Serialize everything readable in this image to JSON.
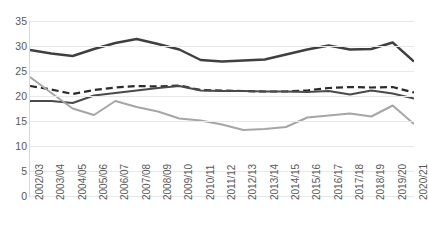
{
  "chart": {
    "title": "",
    "ylabel": "",
    "xlabel": ""
  },
  "chart_data": {
    "type": "line",
    "title": "",
    "subtitle": "",
    "xlabel": "",
    "ylabel": "",
    "ylim": [
      0,
      35
    ],
    "yticks": [
      "0",
      "5",
      "10",
      "15",
      "20",
      "25",
      "30",
      "35"
    ],
    "grid": true,
    "legend": "none",
    "categories": [
      "2002/03",
      "2003/04",
      "2004/05",
      "2005/06",
      "2006/07",
      "2007/08",
      "2008/09",
      "2009/10",
      "2010/11",
      "2011/12",
      "2012/13",
      "2013/14",
      "2014/15",
      "2015/16",
      "2016/17",
      "2017/18",
      "2018/19",
      "2019/20",
      "2020/21"
    ],
    "series": [
      {
        "name": "series-1-dark-solid-upper",
        "style": "solid",
        "color": "#3f3f3f",
        "width": 2.4,
        "values": [
          29.2,
          28.5,
          28.0,
          29.4,
          30.6,
          31.4,
          30.4,
          29.3,
          27.2,
          26.9,
          27.1,
          27.3,
          28.3,
          29.3,
          30.1,
          29.3,
          29.4,
          30.7,
          26.9
        ]
      },
      {
        "name": "series-2-dark-dashed",
        "style": "dashed",
        "color": "#2b2b2b",
        "width": 2.2,
        "values": [
          22.0,
          21.3,
          20.4,
          21.2,
          21.7,
          22.0,
          21.9,
          22.1,
          21.2,
          21.1,
          21.0,
          20.9,
          20.9,
          21.1,
          21.6,
          21.8,
          21.7,
          21.8,
          20.7
        ]
      },
      {
        "name": "series-3-dark-solid-lower",
        "style": "solid",
        "color": "#4a4a4a",
        "width": 2.0,
        "values": [
          19.0,
          19.0,
          18.6,
          20.1,
          20.6,
          21.1,
          21.6,
          22.0,
          21.1,
          21.0,
          21.0,
          20.9,
          20.9,
          20.8,
          21.0,
          20.3,
          21.1,
          20.5,
          19.5
        ]
      },
      {
        "name": "series-4-light-grey-solid",
        "style": "solid",
        "color": "#a6a6a6",
        "width": 2.0,
        "values": [
          23.8,
          20.6,
          17.5,
          16.2,
          19.0,
          17.8,
          16.9,
          15.5,
          15.1,
          14.3,
          13.2,
          13.4,
          13.8,
          15.7,
          16.1,
          16.5,
          15.9,
          18.1,
          14.4
        ]
      }
    ]
  }
}
